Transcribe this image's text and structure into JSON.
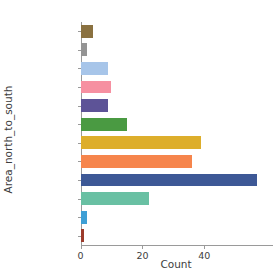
{
  "chart_data": {
    "type": "bar",
    "orientation": "horizontal",
    "title": "",
    "xlabel": "Count",
    "ylabel": "Area_north_to_south",
    "categories": [
      "Tokyo",
      "Kanagawa",
      "Toyama",
      "Ishikawa",
      "Fukui",
      "Nagano",
      "Gifu",
      "Shizuoka",
      "Aichi",
      "Mie",
      "Osaka",
      "Fukuoka"
    ],
    "values": [
      4,
      2,
      9,
      10,
      9,
      15,
      39,
      36,
      57,
      22,
      2,
      1
    ],
    "colors": [
      "#8a7140",
      "#949494",
      "#a7c5e9",
      "#f690a1",
      "#5d5397",
      "#4a9a42",
      "#ddae2b",
      "#f6854c",
      "#3d5896",
      "#69c0a3",
      "#3e9fd5",
      "#9c3b2b"
    ],
    "xlim": [
      0,
      62
    ],
    "xticks": [
      0,
      20,
      40
    ],
    "xtick_labels": [
      "0",
      "20",
      "40"
    ],
    "grid": false,
    "legend": false
  },
  "axes": {
    "x_axis_label": "Count",
    "y_axis_label": "Area_north_to_south"
  }
}
